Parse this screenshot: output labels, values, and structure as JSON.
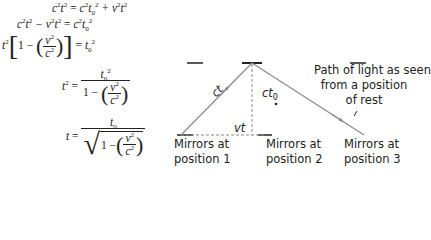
{
  "equations": {
    "eq1": {
      "lhs": "c²t²",
      "rhs": "c²t₀² + v²t²"
    },
    "eq2": {
      "lhs": "c²t² − v²t²",
      "rhs": "c²t₀²"
    },
    "eq3": {
      "lhs": "t²[1 − (v²/c²)]",
      "rhs": "t₀²"
    },
    "eq4": {
      "lhs": "t²",
      "numerator": "t₀²",
      "denominator": "1 − (v²/c²)"
    },
    "eq5": {
      "lhs": "t",
      "numerator": "t₀",
      "denominator": "√(1 − (v²/c²))"
    }
  },
  "diagram": {
    "labels": {
      "ct": "ct",
      "ct0": "ct",
      "ct0_sub": "0",
      "vt": "vt",
      "path_line1": "Path of light as seen",
      "path_line2": "from a position",
      "path_line3": "of rest",
      "mirror1_line1": "Mirrors at",
      "mirror1_line2": "position 1",
      "mirror2_line1": "Mirrors at",
      "mirror2_line2": "position 2",
      "mirror3_line1": "Mirrors at",
      "mirror3_line2": "position 3"
    },
    "colors": {
      "light_path": "#8a8a8a",
      "mirror": "#222222",
      "dashed": "#888888",
      "text": "#222222"
    }
  }
}
